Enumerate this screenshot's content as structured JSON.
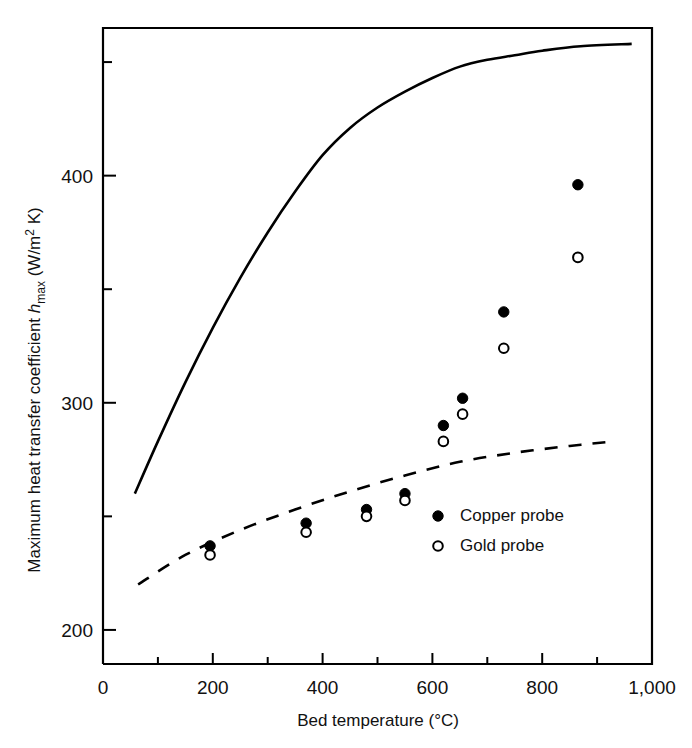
{
  "chart_data": {
    "type": "scatter",
    "title": "",
    "xlabel": "Bed temperature (°C)",
    "ylabel": "Maximum heat transfer coefficient h_max (W/m² K)",
    "ylabel_parts": {
      "lead": "Maximum heat transfer coefficient ",
      "symbol": "h",
      "symbol_sub": "max",
      "units": " (W/m",
      "units_sup": "2",
      "units_tail": " K)"
    },
    "xlim": [
      0,
      1000
    ],
    "ylim": [
      185,
      465
    ],
    "xticks": [
      0,
      200,
      400,
      600,
      800,
      1000
    ],
    "xtick_labels": [
      "0",
      "200",
      "400",
      "600",
      "800",
      "1,000"
    ],
    "xminor_ticks": [
      100,
      300,
      500,
      700,
      900
    ],
    "yticks": [
      200,
      300,
      400
    ],
    "ytick_labels": [
      "200",
      "300",
      "400"
    ],
    "yminor_ticks": [
      250,
      350,
      450
    ],
    "grid": false,
    "legend_position": "lower-right-inside",
    "series": [
      {
        "name": "Copper probe",
        "marker": "filled-circle",
        "color": "#000000",
        "points": [
          {
            "x": 195,
            "y": 237
          },
          {
            "x": 370,
            "y": 247
          },
          {
            "x": 480,
            "y": 253
          },
          {
            "x": 550,
            "y": 260
          },
          {
            "x": 620,
            "y": 290
          },
          {
            "x": 655,
            "y": 302
          },
          {
            "x": 730,
            "y": 340
          },
          {
            "x": 865,
            "y": 396
          }
        ]
      },
      {
        "name": "Gold probe",
        "marker": "open-circle",
        "color": "#000000",
        "points": [
          {
            "x": 195,
            "y": 233
          },
          {
            "x": 370,
            "y": 243
          },
          {
            "x": 480,
            "y": 250
          },
          {
            "x": 550,
            "y": 257
          },
          {
            "x": 620,
            "y": 283
          },
          {
            "x": 655,
            "y": 295
          },
          {
            "x": 730,
            "y": 324
          },
          {
            "x": 865,
            "y": 364
          }
        ]
      }
    ],
    "curves": [
      {
        "name": "upper-solid-curve",
        "style": "solid",
        "color": "#000000",
        "points": [
          {
            "x": 58,
            "y": 260
          },
          {
            "x": 100,
            "y": 283
          },
          {
            "x": 150,
            "y": 309
          },
          {
            "x": 200,
            "y": 333
          },
          {
            "x": 250,
            "y": 355
          },
          {
            "x": 300,
            "y": 375
          },
          {
            "x": 350,
            "y": 393
          },
          {
            "x": 400,
            "y": 409
          },
          {
            "x": 450,
            "y": 421
          },
          {
            "x": 500,
            "y": 430
          },
          {
            "x": 550,
            "y": 437
          },
          {
            "x": 600,
            "y": 443
          },
          {
            "x": 650,
            "y": 448
          },
          {
            "x": 700,
            "y": 451
          },
          {
            "x": 750,
            "y": 453
          },
          {
            "x": 800,
            "y": 455
          },
          {
            "x": 870,
            "y": 457
          },
          {
            "x": 963,
            "y": 458
          }
        ]
      },
      {
        "name": "lower-dashed-curve",
        "style": "dashed",
        "color": "#000000",
        "points": [
          {
            "x": 64,
            "y": 220
          },
          {
            "x": 150,
            "y": 233
          },
          {
            "x": 250,
            "y": 244
          },
          {
            "x": 350,
            "y": 253
          },
          {
            "x": 450,
            "y": 261
          },
          {
            "x": 550,
            "y": 268
          },
          {
            "x": 650,
            "y": 274
          },
          {
            "x": 750,
            "y": 278
          },
          {
            "x": 850,
            "y": 281
          },
          {
            "x": 930,
            "y": 283
          }
        ]
      }
    ],
    "legend": [
      {
        "label": "Copper probe",
        "marker": "filled-circle"
      },
      {
        "label": "Gold probe",
        "marker": "open-circle"
      }
    ]
  }
}
